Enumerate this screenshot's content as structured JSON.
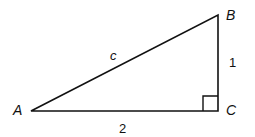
{
  "diagram": {
    "type": "right-triangle",
    "vertices": {
      "A": {
        "label": "A"
      },
      "B": {
        "label": "B"
      },
      "C": {
        "label": "C"
      }
    },
    "sides": {
      "hypotenuse": {
        "label": "c"
      },
      "vertical_leg": {
        "label": "1"
      },
      "horizontal_leg": {
        "label": "2"
      }
    },
    "right_angle_at": "C",
    "colors": {
      "stroke": "#111111",
      "background": "#ffffff"
    }
  }
}
